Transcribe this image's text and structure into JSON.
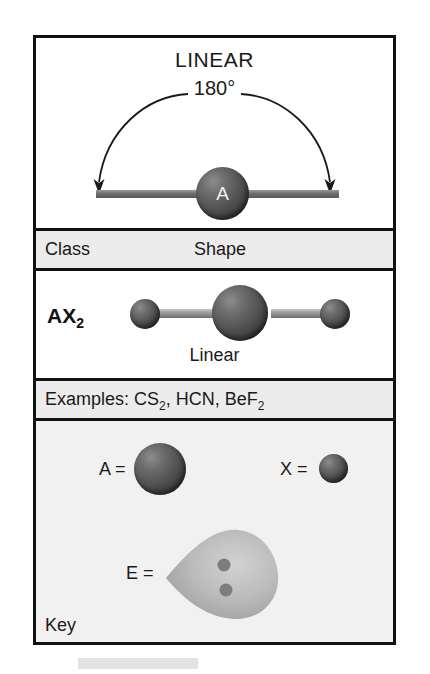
{
  "figure": {
    "geometry_title": "LINEAR",
    "bond_angle": "180°",
    "central_atom_symbol": "A"
  },
  "table": {
    "headers": {
      "class": "Class",
      "shape": "Shape"
    },
    "row": {
      "class_formula_base": "AX",
      "class_formula_sub": "2",
      "shape_name": "Linear"
    },
    "examples": {
      "prefix": "Examples: ",
      "items": [
        {
          "base": "CS",
          "sub": "2",
          "tail": ", "
        },
        {
          "base": "HCN",
          "sub": "",
          "tail": ", "
        },
        {
          "base": "BeF",
          "sub": "2",
          "tail": ""
        }
      ]
    }
  },
  "key": {
    "title": "Key",
    "a_equals": "A =",
    "x_equals": "X =",
    "e_equals": "E =",
    "a_icon": "large-sphere-icon",
    "x_icon": "small-sphere-icon",
    "e_icon": "lone-pair-lobe-icon"
  },
  "colors": {
    "frame": "#111111",
    "header_band": "#ececec",
    "key_background": "#f1f1f1",
    "atom_dark": "#4a4a4a",
    "bond_gray": "#9d9d9d",
    "lobe_gray": "#b4b4b4",
    "page_background": "#ffffff"
  }
}
